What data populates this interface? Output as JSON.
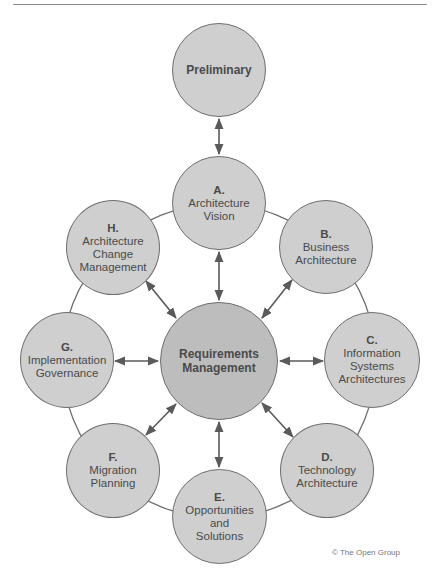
{
  "diagram": {
    "colors": {
      "node_fill": "#cfcfcf",
      "core_fill": "#bdbdbd",
      "stroke": "#6f6f6f",
      "text": "#4a4a4a"
    },
    "nodes": {
      "preliminary": {
        "letter": "",
        "label": "Preliminary"
      },
      "a": {
        "letter": "A.",
        "line1": "Architecture",
        "line2": "Vision"
      },
      "b": {
        "letter": "B.",
        "line1": "Business",
        "line2": "Architecture"
      },
      "c": {
        "letter": "C.",
        "line1": "Information",
        "line2": "Systems",
        "line3": "Architectures"
      },
      "d": {
        "letter": "D.",
        "line1": "Technology",
        "line2": "Architecture"
      },
      "e": {
        "letter": "E.",
        "line1": "Opportunities",
        "line2": "and",
        "line3": "Solutions"
      },
      "f": {
        "letter": "F.",
        "line1": "Migration",
        "line2": "Planning"
      },
      "g": {
        "letter": "G.",
        "line1": "Implementation",
        "line2": "Governance"
      },
      "h": {
        "letter": "H.",
        "line1": "Architecture",
        "line2": "Change",
        "line3": "Management"
      },
      "core": {
        "line1": "Requirements",
        "line2": "Management"
      }
    },
    "edges": [
      [
        "Preliminary",
        "A"
      ],
      [
        "A",
        "Requirements Management"
      ],
      [
        "B",
        "Requirements Management"
      ],
      [
        "C",
        "Requirements Management"
      ],
      [
        "D",
        "Requirements Management"
      ],
      [
        "E",
        "Requirements Management"
      ],
      [
        "F",
        "Requirements Management"
      ],
      [
        "G",
        "Requirements Management"
      ],
      [
        "H",
        "Requirements Management"
      ]
    ],
    "cycle": [
      "A",
      "B",
      "C",
      "D",
      "E",
      "F",
      "G",
      "H"
    ],
    "copyright": "© The Open Group"
  }
}
